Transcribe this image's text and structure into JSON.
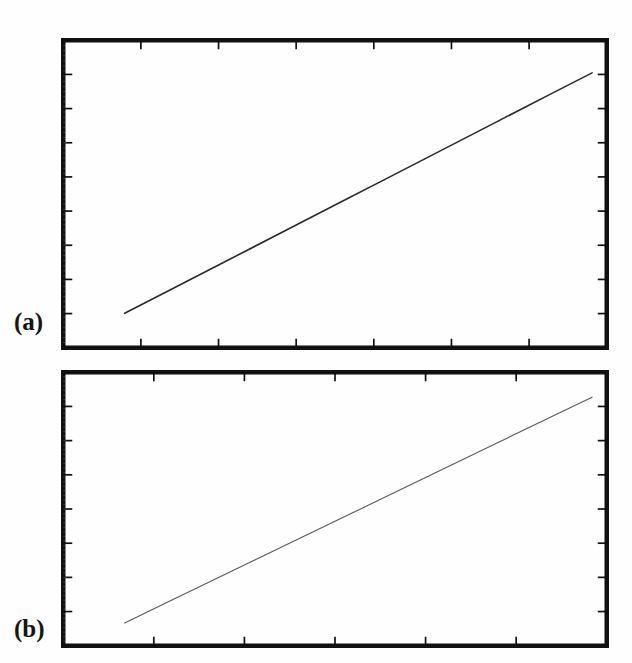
{
  "figure": {
    "title": "",
    "background_color": "#ffffff",
    "width": 632,
    "height": 663,
    "frame_color": "#111111",
    "line_color_a": "#2a2a2a",
    "line_color_b": "#5a5a5a"
  },
  "panels": [
    {
      "id": "a",
      "label": "(a)",
      "frame": {
        "x": 6,
        "y": 5,
        "w": 548,
        "h": 312
      },
      "axes": {
        "grid": false,
        "tick_direction": "in",
        "x_ticks_major": 6,
        "y_ticks_major": 8,
        "x_tick_labels": [],
        "y_tick_labels": [],
        "xlabel": "",
        "ylabel": ""
      }
    },
    {
      "id": "b",
      "label": "(b)",
      "frame": {
        "x": 6,
        "y": 5,
        "w": 548,
        "h": 278
      },
      "axes": {
        "grid": false,
        "tick_direction": "in",
        "x_ticks_major": 5,
        "y_ticks_major": 7,
        "x_tick_labels": [],
        "y_tick_labels": [],
        "xlabel": "",
        "ylabel": ""
      }
    }
  ],
  "chart_data": [
    {
      "type": "line",
      "panel": "a",
      "title": "",
      "subtitle": "",
      "xlabel": "",
      "ylabel": "",
      "xlim": [
        0,
        1
      ],
      "ylim": [
        0,
        1
      ],
      "grid": false,
      "legend": null,
      "series": [
        {
          "name": "series-a",
          "color": "#2a2a2a",
          "linewidth": 1.6,
          "x": [
            0.113,
            0.2,
            0.3,
            0.4,
            0.5,
            0.6,
            0.7,
            0.8,
            0.9,
            0.973
          ],
          "y": [
            0.112,
            0.191,
            0.282,
            0.373,
            0.464,
            0.555,
            0.646,
            0.737,
            0.828,
            0.894
          ]
        }
      ],
      "annotations": []
    },
    {
      "type": "line",
      "panel": "b",
      "title": "",
      "subtitle": "",
      "xlabel": "",
      "ylabel": "",
      "xlim": [
        0,
        1
      ],
      "ylim": [
        0,
        1
      ],
      "grid": false,
      "legend": null,
      "series": [
        {
          "name": "series-b",
          "color": "#5a5a5a",
          "linewidth": 1.1,
          "x": [
            0.113,
            0.2,
            0.3,
            0.4,
            0.5,
            0.6,
            0.7,
            0.8,
            0.9,
            0.973
          ],
          "y": [
            0.083,
            0.167,
            0.263,
            0.359,
            0.455,
            0.551,
            0.647,
            0.743,
            0.839,
            0.909
          ]
        }
      ],
      "annotations": []
    }
  ]
}
